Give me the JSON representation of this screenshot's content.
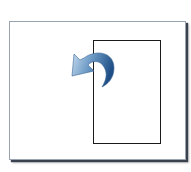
{
  "icon": {
    "name": "rotate-page-counterclockwise",
    "colors": {
      "page_border": "#9aa3b0",
      "page_shadow": "#3a4250",
      "rect_border": "#1a1a1a",
      "arrow_light": "#a9c6e0",
      "arrow_dark": "#1f4f86"
    }
  }
}
